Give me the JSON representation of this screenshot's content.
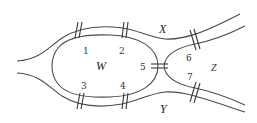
{
  "diagram": {
    "type": "bridges-of-river",
    "regions": [
      {
        "id": "W",
        "label": "W"
      },
      {
        "id": "X",
        "label": "X"
      },
      {
        "id": "Y",
        "label": "Y"
      },
      {
        "id": "Z",
        "label": "Z"
      }
    ],
    "bridges": [
      {
        "id": "1",
        "label": "1",
        "connects": [
          "W",
          "X"
        ]
      },
      {
        "id": "2",
        "label": "2",
        "connects": [
          "W",
          "X"
        ]
      },
      {
        "id": "3",
        "label": "3",
        "connects": [
          "W",
          "Y"
        ]
      },
      {
        "id": "4",
        "label": "4",
        "connects": [
          "W",
          "Y"
        ]
      },
      {
        "id": "5",
        "label": "5",
        "connects": [
          "W",
          "Z"
        ]
      },
      {
        "id": "6",
        "label": "6",
        "connects": [
          "X",
          "Z"
        ]
      },
      {
        "id": "7",
        "label": "7",
        "connects": [
          "Y",
          "Z"
        ]
      }
    ],
    "colors": {
      "line": "#4a4a4a",
      "background": "#ffffff"
    }
  }
}
